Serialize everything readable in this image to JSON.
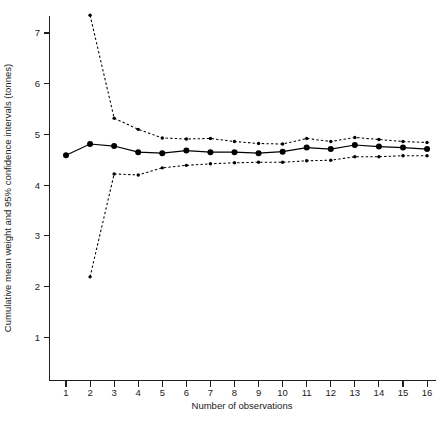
{
  "chart_data": {
    "type": "line",
    "title": "",
    "xlabel": "Number of observations",
    "ylabel": "Cumulative mean weight and 95% confidence intervals (tonnes)",
    "x": [
      1,
      2,
      3,
      4,
      5,
      6,
      7,
      8,
      9,
      10,
      11,
      12,
      13,
      14,
      15,
      16
    ],
    "xlim": [
      0.5,
      16.5
    ],
    "ylim": [
      0.55,
      7.65
    ],
    "xticks": [
      "1",
      "2",
      "3",
      "4",
      "5",
      "6",
      "7",
      "8",
      "9",
      "10",
      "11",
      "12",
      "13",
      "14",
      "15",
      "16"
    ],
    "yticks": [
      "1",
      "2",
      "3",
      "4",
      "5",
      "6",
      "7"
    ],
    "ytick_values": [
      1,
      2,
      3,
      4,
      5,
      6,
      7
    ],
    "grid": false,
    "legend": "none",
    "series": [
      {
        "name": "Upper 95% confidence interval",
        "style": "dotted",
        "marker": "small-filled-circle",
        "x": [
          2,
          3,
          4,
          5,
          6,
          7,
          8,
          9,
          10,
          11,
          12,
          13,
          14,
          15,
          16
        ],
        "values": [
          7.35,
          5.32,
          5.1,
          4.93,
          4.91,
          4.92,
          4.86,
          4.82,
          4.81,
          4.92,
          4.86,
          4.94,
          4.9,
          4.86,
          4.84
        ]
      },
      {
        "name": "Cumulative mean weight",
        "style": "solid",
        "marker": "large-filled-circle",
        "x": [
          1,
          2,
          3,
          4,
          5,
          6,
          7,
          8,
          9,
          10,
          11,
          12,
          13,
          14,
          15,
          16
        ],
        "values": [
          4.59,
          4.81,
          4.77,
          4.65,
          4.63,
          4.68,
          4.65,
          4.65,
          4.63,
          4.66,
          4.74,
          4.71,
          4.79,
          4.76,
          4.74,
          4.71
        ]
      },
      {
        "name": "Lower 95% confidence interval",
        "style": "dotted",
        "marker": "small-filled-circle",
        "x": [
          2,
          3,
          4,
          5,
          6,
          7,
          8,
          9,
          10,
          11,
          12,
          13,
          14,
          15,
          16
        ],
        "values": [
          2.19,
          4.22,
          4.2,
          4.34,
          4.39,
          4.42,
          4.44,
          4.45,
          4.45,
          4.48,
          4.49,
          4.56,
          4.56,
          4.58,
          4.58
        ]
      }
    ]
  },
  "axes": {
    "x_title": "Number of observations",
    "y_title": "Cumulative mean weight and 95% confidence intervals (tonnes)"
  }
}
